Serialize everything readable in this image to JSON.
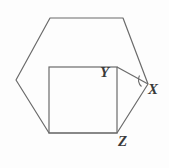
{
  "figure": {
    "background_color": "#fdfdfd",
    "stroke_color": "#6b6b6b",
    "label_color": "#3a3a3a",
    "stroke_width": 1.2,
    "width": 169,
    "height": 168
  },
  "labels": {
    "x": "X",
    "y": "Y",
    "z": "Z"
  },
  "shapes": {
    "hexagon": {
      "name": "hexagon",
      "points": "50,18 123,18 148,84 117,133 49,133 16,80"
    },
    "square": {
      "name": "square",
      "x": 49,
      "y": 67,
      "width": 68,
      "height": 66
    },
    "segment_y_to_x": {
      "name": "segment-Y-X",
      "x1": 117,
      "y1": 67,
      "x2": 148,
      "y2": 84
    },
    "angle_arc_at_x": {
      "name": "angle-arc-at-X",
      "d": "M 139.5,75.5 A 9 9 0 0 0 141.5,86.5"
    }
  }
}
